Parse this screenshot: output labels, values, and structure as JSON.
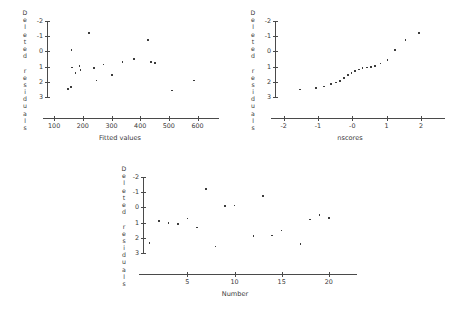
{
  "figure": {
    "background_color": "#ffffff",
    "ink_color": "#3c3c3c",
    "axis_color": "#4a4a4a"
  },
  "panels": [
    {
      "name": "fitted-values-panel",
      "ylabel_text": "Deleted residuals",
      "ylabel_chars": [
        "D",
        "e",
        "l",
        "e",
        "t",
        "e",
        "d",
        " ",
        "r",
        "e",
        "s",
        "i",
        "d",
        "u",
        "a",
        "l",
        "s"
      ],
      "xtitle": "Fitted values",
      "ytick_labels": [
        "3",
        "2",
        "1",
        "0",
        "-1",
        "-2"
      ],
      "xtick_labels": [
        "100",
        "200",
        "300",
        "400",
        "500",
        "600"
      ]
    },
    {
      "name": "nscores-panel",
      "ylabel_text": "Deleted residuals",
      "ylabel_chars": [
        "D",
        "e",
        "l",
        "e",
        "t",
        "e",
        "d",
        " ",
        "r",
        "e",
        "s",
        "i",
        "d",
        "u",
        "a",
        "l",
        "s"
      ],
      "xtitle": "nscores",
      "ytick_labels": [
        "3",
        "2",
        "1",
        "0",
        "-1",
        "-2"
      ],
      "xtick_labels": [
        "-2",
        "-1",
        "-0",
        "1",
        "2"
      ]
    },
    {
      "name": "number-panel",
      "ylabel_text": "Deleted residuals",
      "ylabel_chars": [
        "D",
        "e",
        "l",
        "e",
        "t",
        "e",
        "d",
        " ",
        "r",
        "e",
        "s",
        "i",
        "d",
        "u",
        "a",
        "l",
        "s"
      ],
      "xtitle": "Number",
      "ytick_labels": [
        "3",
        "2",
        "1",
        "0",
        "-1",
        "-2"
      ],
      "xtick_labels": [
        "5",
        "10",
        "15",
        "20"
      ]
    }
  ],
  "chart_data": [
    {
      "type": "scatter",
      "title": "",
      "xlabel": "Fitted values",
      "ylabel": "Deleted residuals",
      "xlim": [
        75,
        640
      ],
      "ylim": [
        -2.45,
        3.2
      ],
      "xticks": [
        100,
        200,
        300,
        400,
        500,
        600
      ],
      "yticks": [
        -2,
        -1,
        0,
        1,
        2,
        3
      ],
      "grid": false,
      "legend": "none",
      "points": [
        {
          "x": 148,
          "y": -1.45
        },
        {
          "x": 158,
          "y": -1.35
        },
        {
          "x": 160,
          "y": 1.1
        },
        {
          "x": 163,
          "y": -0.05
        },
        {
          "x": 175,
          "y": -0.4
        },
        {
          "x": 188,
          "y": 0.05
        },
        {
          "x": 192,
          "y": -0.2
        },
        {
          "x": 222,
          "y": 2.2
        },
        {
          "x": 238,
          "y": -0.1
        },
        {
          "x": 248,
          "y": -0.9
        },
        {
          "x": 272,
          "y": 0.15
        },
        {
          "x": 302,
          "y": -0.55
        },
        {
          "x": 338,
          "y": 0.3
        },
        {
          "x": 378,
          "y": 0.5
        },
        {
          "x": 428,
          "y": 1.75
        },
        {
          "x": 438,
          "y": 0.3
        },
        {
          "x": 452,
          "y": 0.25
        },
        {
          "x": 512,
          "y": -1.55
        },
        {
          "x": 588,
          "y": -0.9
        }
      ]
    },
    {
      "type": "scatter",
      "title": "",
      "xlabel": "nscores",
      "ylabel": "Deleted residuals",
      "xlim": [
        -2.25,
        2.35
      ],
      "ylim": [
        -2.45,
        3.2
      ],
      "xticks": [
        -2,
        -1,
        0,
        1,
        2
      ],
      "yticks": [
        -2,
        -1,
        0,
        1,
        2,
        3
      ],
      "grid": false,
      "legend": "none",
      "points": [
        {
          "x": -1.52,
          "y": -1.5
        },
        {
          "x": -1.05,
          "y": -1.4
        },
        {
          "x": -0.82,
          "y": -1.3
        },
        {
          "x": -0.62,
          "y": -1.15
        },
        {
          "x": -0.48,
          "y": -1.05
        },
        {
          "x": -0.36,
          "y": -0.95
        },
        {
          "x": -0.24,
          "y": -0.75
        },
        {
          "x": -0.12,
          "y": -0.55
        },
        {
          "x": -0.02,
          "y": -0.4
        },
        {
          "x": 0.08,
          "y": -0.28
        },
        {
          "x": 0.2,
          "y": -0.18
        },
        {
          "x": 0.3,
          "y": -0.1
        },
        {
          "x": 0.42,
          "y": -0.04
        },
        {
          "x": 0.54,
          "y": 0.0
        },
        {
          "x": 0.66,
          "y": 0.05
        },
        {
          "x": 0.82,
          "y": 0.2
        },
        {
          "x": 1.02,
          "y": 0.45
        },
        {
          "x": 1.25,
          "y": 1.1
        },
        {
          "x": 1.55,
          "y": 1.75
        },
        {
          "x": 1.95,
          "y": 2.2
        }
      ]
    },
    {
      "type": "scatter",
      "title": "",
      "xlabel": "Number",
      "ylabel": "Deleted residuals",
      "xlim": [
        0.3,
        21.5
      ],
      "ylim": [
        -2.45,
        3.2
      ],
      "xticks": [
        5,
        10,
        15,
        20
      ],
      "yticks": [
        -2,
        -1,
        0,
        1,
        2,
        3
      ],
      "grid": false,
      "legend": "none",
      "points": [
        {
          "x": 1,
          "y": -1.35
        },
        {
          "x": 2,
          "y": 0.1
        },
        {
          "x": 3,
          "y": -0.02
        },
        {
          "x": 4,
          "y": -0.08
        },
        {
          "x": 5,
          "y": 0.28
        },
        {
          "x": 6,
          "y": -0.32
        },
        {
          "x": 7,
          "y": 2.2
        },
        {
          "x": 8,
          "y": -1.55
        },
        {
          "x": 9,
          "y": 1.1
        },
        {
          "x": 10,
          "y": 1.12
        },
        {
          "x": 12,
          "y": -0.88
        },
        {
          "x": 13,
          "y": 1.75
        },
        {
          "x": 14,
          "y": -0.85
        },
        {
          "x": 15,
          "y": -0.5
        },
        {
          "x": 17,
          "y": -1.38
        },
        {
          "x": 18,
          "y": 0.22
        },
        {
          "x": 19,
          "y": 0.52
        },
        {
          "x": 20,
          "y": 0.32
        }
      ]
    }
  ]
}
